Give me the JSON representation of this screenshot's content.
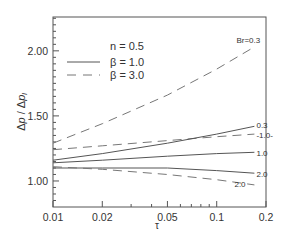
{
  "chart_data": {
    "type": "line",
    "title": "",
    "xlabel": "τ",
    "ylabel": "Δp / Δp_l",
    "xscale": "log",
    "xlim": [
      0.01,
      0.2
    ],
    "ylim": [
      0.8,
      2.26
    ],
    "x_ticks": [
      {
        "value": 0.01,
        "label": "0.01"
      },
      {
        "value": 0.02,
        "label": "0.02"
      },
      {
        "value": 0.05,
        "label": "0.05"
      },
      {
        "value": 0.1,
        "label": "0.1"
      },
      {
        "value": 0.2,
        "label": "0.2"
      }
    ],
    "y_ticks": [
      {
        "value": 1.0,
        "label": "1.00"
      },
      {
        "value": 1.5,
        "label": "1.50"
      },
      {
        "value": 2.0,
        "label": "2.00"
      }
    ],
    "grid": false,
    "legend": {
      "position": "upper-left",
      "header": "n = 0.5",
      "entries": [
        {
          "label": "β = 1.0",
          "style": "solid"
        },
        {
          "label": "β = 3.0",
          "style": "dashed"
        }
      ]
    },
    "series": [
      {
        "name": "β = 3.0, Br = 0.3",
        "style": "dashed",
        "label": "Br=0.3",
        "x": [
          0.01,
          0.02,
          0.05,
          0.1,
          0.17
        ],
        "y": [
          1.29,
          1.44,
          1.66,
          1.86,
          2.03
        ]
      },
      {
        "name": "β = 3.0, Br = -1.0",
        "style": "dashed",
        "label": "-1.0-",
        "x": [
          0.01,
          0.02,
          0.05,
          0.1,
          0.17
        ],
        "y": [
          1.24,
          1.27,
          1.31,
          1.34,
          1.36
        ]
      },
      {
        "name": "β = 1.0, Br = 0.3",
        "style": "solid",
        "label": "0.3",
        "x": [
          0.01,
          0.02,
          0.05,
          0.1,
          0.17
        ],
        "y": [
          1.16,
          1.21,
          1.29,
          1.36,
          1.42
        ]
      },
      {
        "name": "β = 1.0, Br = 1.0",
        "style": "solid",
        "label": "1.0",
        "x": [
          0.01,
          0.02,
          0.05,
          0.1,
          0.17
        ],
        "y": [
          1.14,
          1.16,
          1.19,
          1.21,
          1.22
        ]
      },
      {
        "name": "β = 1.0, Br = 2.0",
        "style": "solid",
        "label": "2.0",
        "x": [
          0.01,
          0.02,
          0.05,
          0.1,
          0.17
        ],
        "y": [
          1.1,
          1.1,
          1.1,
          1.08,
          1.06
        ]
      },
      {
        "name": "β = 3.0, Br = 2.0",
        "style": "dashed",
        "label": "2.0",
        "x": [
          0.01,
          0.02,
          0.05,
          0.1,
          0.17
        ],
        "y": [
          1.11,
          1.09,
          1.05,
          1.01,
          0.97
        ]
      }
    ]
  }
}
